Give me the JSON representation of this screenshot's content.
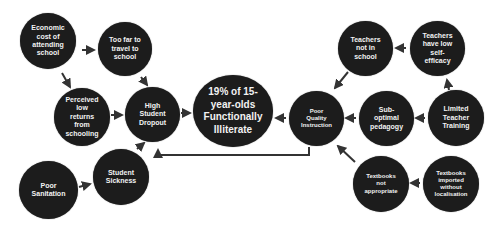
{
  "diagram": {
    "colors": {
      "node_fill": "#1c1c1c",
      "node_text": "#f2f2f2",
      "edge": "#333333",
      "background": "#ffffff"
    },
    "nodes": {
      "economic_cost": {
        "label": "Economic\ncost of\nattending\nschool"
      },
      "too_far": {
        "label": "Too far to\ntravel to\nschool"
      },
      "perceived_low_returns": {
        "label": "Perceived\nlow\nreturns\nfrom\nschooling"
      },
      "high_dropout": {
        "label": "High\nStudent\nDropout"
      },
      "functionally_illiterate": {
        "label": "19% of 15-\nyear-olds\nFunctionally\nIlliterate"
      },
      "poor_sanitation": {
        "label": "Poor\nSanitation"
      },
      "student_sickness": {
        "label": "Student\nSickness"
      },
      "poor_quality_instruction": {
        "label": "Poor\nQuality\nInstruction"
      },
      "teachers_not_in_school": {
        "label": "Teachers\nnot in\nschool"
      },
      "teachers_low_efficacy": {
        "label": "Teachers\nhave low\nself-\nefficacy"
      },
      "suboptimal_pedagogy": {
        "label": "Sub-\noptimal\npedagogy"
      },
      "limited_training": {
        "label": "Limited\nTeacher\nTraining"
      },
      "textbooks_not_appropriate": {
        "label": "Textbooks\nnot\nappropriate"
      },
      "textbooks_imported": {
        "label": "Textbooks\nimported\nwithout\nlocalisation"
      }
    },
    "edges": [
      {
        "from": "economic_cost",
        "to": "too_far"
      },
      {
        "from": "economic_cost",
        "to": "perceived_low_returns"
      },
      {
        "from": "too_far",
        "to": "high_dropout"
      },
      {
        "from": "perceived_low_returns",
        "to": "high_dropout"
      },
      {
        "from": "high_dropout",
        "to": "functionally_illiterate"
      },
      {
        "from": "poor_sanitation",
        "to": "student_sickness"
      },
      {
        "from": "student_sickness",
        "to": "high_dropout"
      },
      {
        "from": "poor_quality_instruction",
        "to": "functionally_illiterate"
      },
      {
        "from": "poor_quality_instruction",
        "to": "high_dropout"
      },
      {
        "from": "teachers_not_in_school",
        "to": "poor_quality_instruction"
      },
      {
        "from": "teachers_low_efficacy",
        "to": "teachers_not_in_school"
      },
      {
        "from": "limited_training",
        "to": "teachers_low_efficacy"
      },
      {
        "from": "limited_training",
        "to": "suboptimal_pedagogy"
      },
      {
        "from": "suboptimal_pedagogy",
        "to": "poor_quality_instruction"
      },
      {
        "from": "textbooks_not_appropriate",
        "to": "poor_quality_instruction"
      },
      {
        "from": "textbooks_imported",
        "to": "textbooks_not_appropriate"
      }
    ]
  }
}
